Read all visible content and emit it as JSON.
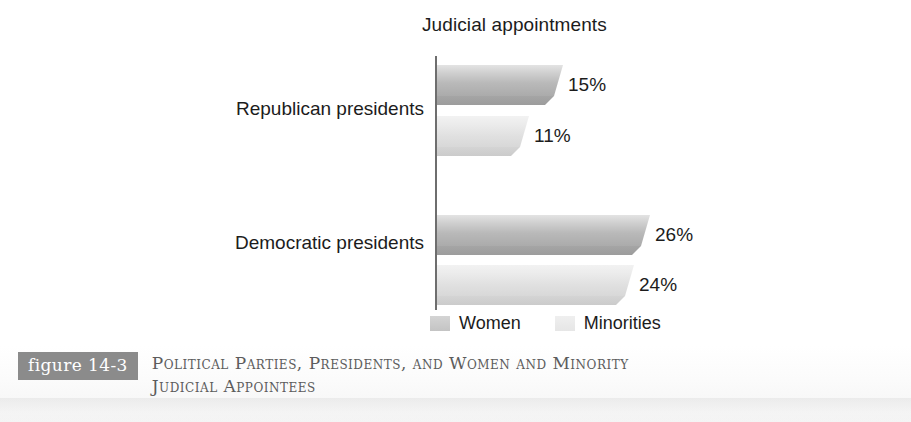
{
  "chart_data": {
    "type": "bar",
    "orientation": "horizontal",
    "title": "Judicial appointments",
    "xlabel": "",
    "ylabel": "",
    "categories": [
      "Republican presidents",
      "Democratic presidents"
    ],
    "series": [
      {
        "name": "Women",
        "values": [
          15,
          24
        ],
        "color": "#b9b9b9",
        "value_labels": [
          "15%",
          "26%"
        ]
      },
      {
        "name": "Minorities",
        "values": [
          11,
          24
        ],
        "color": "#e0e0e0",
        "value_labels": [
          "11%",
          "24%"
        ]
      }
    ],
    "points": [
      {
        "category": "Republican presidents",
        "series": "Women",
        "value": 15,
        "label": "15%"
      },
      {
        "category": "Republican presidents",
        "series": "Minorities",
        "value": 11,
        "label": "11%"
      },
      {
        "category": "Democratic presidents",
        "series": "Women",
        "value": 26,
        "label": "26%"
      },
      {
        "category": "Democratic presidents",
        "series": "Minorities",
        "value": 24,
        "label": "24%"
      }
    ],
    "xlim": [
      0,
      30
    ],
    "grid": false,
    "legend_position": "bottom"
  },
  "chart": {
    "title": "Judicial appointments",
    "categories": [
      {
        "label": "Republican presidents",
        "bars": [
          {
            "series": "Women",
            "value": 15,
            "value_label": "15%"
          },
          {
            "series": "Minorities",
            "value": 11,
            "value_label": "11%"
          }
        ]
      },
      {
        "label": "Democratic presidents",
        "bars": [
          {
            "series": "Women",
            "value": 26,
            "value_label": "26%"
          },
          {
            "series": "Minorities",
            "value": 24,
            "value_label": "24%"
          }
        ]
      }
    ],
    "legend": [
      {
        "label": "Women",
        "color": "#c4c4c4"
      },
      {
        "label": "Minorities",
        "color": "#e6e6e6"
      }
    ]
  },
  "figure": {
    "tag": "figure 14-3",
    "tag_background": "#8b8b8b",
    "caption_line_1": "Political Parties, Presidents, and Women and Minority",
    "caption_line_2": "Judicial Appointees",
    "caption_color": "#5c5c5c"
  }
}
